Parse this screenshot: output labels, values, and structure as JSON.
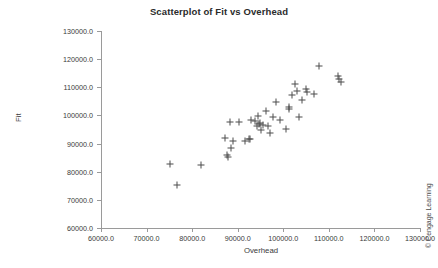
{
  "chart_data": {
    "type": "scatter",
    "title": "Scatterplot of Fit vs Overhead",
    "xlabel": "Overhead",
    "ylabel": "Fit",
    "xlim": [
      60000,
      130000
    ],
    "ylim": [
      60000,
      130000
    ],
    "xticks": [
      "60000.0",
      "70000.0",
      "80000.0",
      "90000.0",
      "100000.0",
      "110000.0",
      "120000.0",
      "130000.0"
    ],
    "yticks": [
      "60000.0",
      "70000.0",
      "80000.0",
      "90000.0",
      "100000.0",
      "110000.0",
      "120000.0",
      "130000.0"
    ],
    "xtick_values": [
      60000,
      70000,
      80000,
      90000,
      100000,
      110000,
      120000,
      130000
    ],
    "ytick_values": [
      60000,
      70000,
      80000,
      90000,
      100000,
      110000,
      120000,
      130000
    ],
    "grid": false,
    "legend": null,
    "marker": "plus",
    "marker_color": "#4d4d4d",
    "series": [
      {
        "name": "Fit vs Overhead",
        "points": [
          [
            75100,
            82600
          ],
          [
            76700,
            75200
          ],
          [
            82000,
            82300
          ],
          [
            87300,
            92100
          ],
          [
            87700,
            85900
          ],
          [
            87800,
            85200
          ],
          [
            88400,
            97600
          ],
          [
            88600,
            88600
          ],
          [
            88900,
            91000
          ],
          [
            90300,
            97500
          ],
          [
            91500,
            91000
          ],
          [
            92400,
            91600
          ],
          [
            92600,
            91500
          ],
          [
            93000,
            98200
          ],
          [
            93800,
            97900
          ],
          [
            94300,
            96300
          ],
          [
            94500,
            99900
          ],
          [
            94700,
            96800
          ],
          [
            94900,
            97200
          ],
          [
            95000,
            94700
          ],
          [
            95600,
            96600
          ],
          [
            96100,
            101400
          ],
          [
            96600,
            96400
          ],
          [
            97100,
            93800
          ],
          [
            97700,
            99300
          ],
          [
            98400,
            104600
          ],
          [
            99300,
            98300
          ],
          [
            100600,
            95300
          ],
          [
            101200,
            102300
          ],
          [
            101300,
            103000
          ],
          [
            102000,
            107100
          ],
          [
            102500,
            111000
          ],
          [
            102900,
            108700
          ],
          [
            103500,
            99500
          ],
          [
            104200,
            105400
          ],
          [
            104900,
            109400
          ],
          [
            105300,
            108200
          ],
          [
            106700,
            107600
          ],
          [
            107900,
            117500
          ],
          [
            111900,
            114100
          ],
          [
            112200,
            113100
          ],
          [
            112600,
            111900
          ]
        ]
      }
    ]
  },
  "credit": "© Cengage Learning"
}
